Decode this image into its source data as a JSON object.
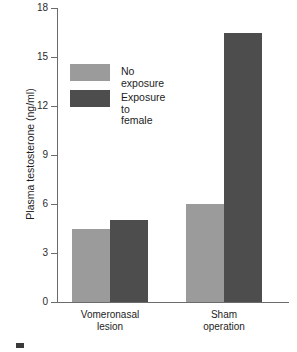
{
  "chart_data": {
    "type": "bar",
    "title": "",
    "xlabel": "",
    "ylabel": "Plasma testosterone (ng/ml)",
    "ylim": [
      0,
      18
    ],
    "ytick_labels": [
      "0",
      "3",
      "6",
      "9",
      "12",
      "15",
      "18"
    ],
    "ytick_values": [
      0,
      3,
      6,
      9,
      12,
      15,
      18
    ],
    "grid": false,
    "legend_position": "upper-left-inside",
    "categories": [
      "Vomeronasal\nlesion",
      "Sham\noperation"
    ],
    "series": [
      {
        "name": "No exposure",
        "color": "#9b9b9b",
        "values": [
          4.5,
          6.0
        ]
      },
      {
        "name": "Exposure to\nfemale",
        "color": "#4d4d4d",
        "values": [
          5.0,
          16.5
        ]
      }
    ]
  },
  "figure": {
    "background_color": "#ffffff",
    "axis_color": "#6b6b6b",
    "text_color": "#1d1d1d"
  }
}
